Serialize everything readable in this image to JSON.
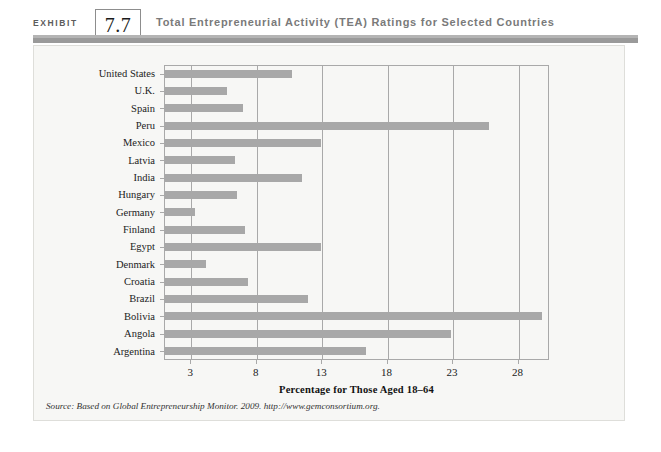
{
  "header": {
    "exhibit_label": "EXHIBIT",
    "exhibit_number": "7.7",
    "title": "Total Entrepreneurial Activity (TEA) Ratings for Selected Countries"
  },
  "source_note": "Source: Based on Global Entrepreneurship Monitor. 2009. http://www.gemconsortium.org.",
  "colors": {
    "bar": "#a8a8a8",
    "rule": "#9a9a9a",
    "panel_bg": "#f7f7f5",
    "axis": "#a9a9a9"
  },
  "chart_data": {
    "type": "bar",
    "orientation": "horizontal",
    "title": "Total Entrepreneurial Activity (TEA) Ratings for Selected Countries",
    "xlabel": "Percentage for Those Aged 18–64",
    "ylabel": "",
    "xlim": [
      1,
      30.4
    ],
    "xticks": [
      3,
      8,
      13,
      18,
      23,
      28
    ],
    "grid": true,
    "legend": null,
    "categories": [
      "United States",
      "U.K.",
      "Spain",
      "Peru",
      "Mexico",
      "Latvia",
      "India",
      "Hungary",
      "Germany",
      "Finland",
      "Egypt",
      "Denmark",
      "Croatia",
      "Brazil",
      "Bolivia",
      "Angola",
      "Argentina"
    ],
    "values": [
      10.8,
      5.8,
      7.0,
      25.8,
      13.0,
      6.4,
      11.5,
      6.6,
      3.4,
      7.2,
      13.0,
      4.2,
      7.4,
      12.0,
      29.9,
      22.9,
      16.4
    ]
  }
}
